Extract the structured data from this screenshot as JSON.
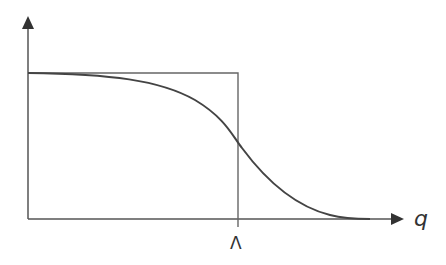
{
  "diagram": {
    "type": "cutoff-function-plot",
    "labels": {
      "x_axis": "q",
      "cutoff": "Λ"
    },
    "elements": [
      {
        "name": "y-axis",
        "kind": "arrow",
        "direction": "up"
      },
      {
        "name": "x-axis",
        "kind": "arrow",
        "direction": "right"
      },
      {
        "name": "sharp-cutoff-step",
        "kind": "rectangle-step",
        "description": "constant value up to Λ, then zero"
      },
      {
        "name": "smooth-cutoff-curve",
        "kind": "curve",
        "description": "smooth decreasing function crossing the step at Λ"
      }
    ],
    "colors": {
      "axis": "#555555",
      "step": "#666666",
      "curve": "#444444"
    }
  }
}
